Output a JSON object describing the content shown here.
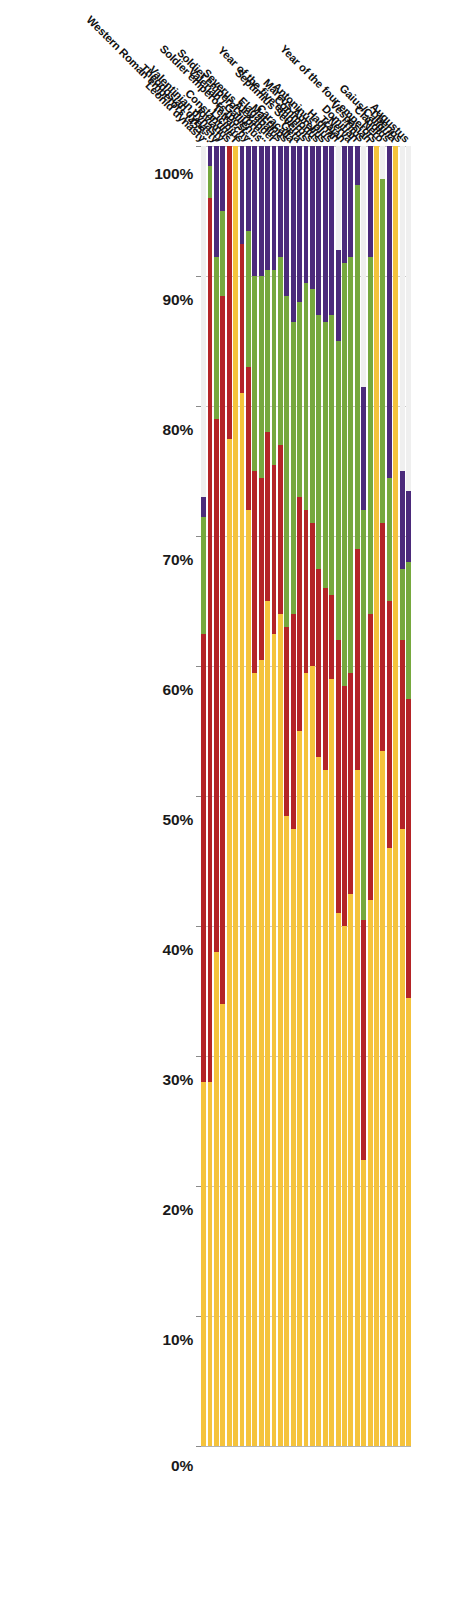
{
  "chart_data": {
    "type": "bar",
    "subtype": "stacked-horizontal-100-percent",
    "title": "",
    "subtitle": "",
    "xlabel": "",
    "ylabel": "",
    "orientation": "rotated-90-degrees",
    "value_axis": {
      "ticks": [
        "100%",
        "90%",
        "80%",
        "70%",
        "60%",
        "50%",
        "40%",
        "30%",
        "20%",
        "10%",
        "0%"
      ],
      "values": [
        100,
        90,
        80,
        70,
        60,
        50,
        40,
        30,
        20,
        10,
        0
      ],
      "range": [
        0,
        100
      ],
      "direction": "100-to-0",
      "grid": true
    },
    "legend": {
      "visible": false,
      "position": "none"
    },
    "series": [
      {
        "name": "series-1",
        "color": "#EFEFEF"
      },
      {
        "name": "series-2",
        "color": "#4B2A7B"
      },
      {
        "name": "series-3",
        "color": "#76A83E"
      },
      {
        "name": "series-4",
        "color": "#B42427"
      },
      {
        "name": "series-5",
        "color": "#F5C33C"
      }
    ],
    "categories": [
      "Augustus",
      "Tiberius",
      "Gaius/Caligula",
      "Claudius",
      "Nero",
      "Year of the four emperors",
      "Vespasian",
      "Titus",
      "Domitian",
      "Nerva",
      "Trajan",
      "Hadrian",
      "Antoninus plus",
      "Marcus Aurelius",
      "Commodus",
      "Year of the five emperors",
      "Septimius Severus",
      "Geta",
      "Caracalla",
      "Macrinus",
      "Elagabalus",
      "Severus Alexander",
      "Soldier emperors (pre-...",
      "Valerian / Gallienus",
      "Soldier emperors (post-...",
      "Tetrarchy",
      "Licinius",
      "Constantine I",
      "Jovianus",
      "Valentinian dynasty",
      "Theodosian dynasty",
      "Western Roman emperors (455-...",
      "Leonid dynasty"
    ],
    "rows": [
      {
        "category": "Augustus",
        "values": [
          26.5,
          5.5,
          10.5,
          23.0,
          34.5
        ]
      },
      {
        "category": "Tiberius",
        "values": [
          25.0,
          7.5,
          5.5,
          14.5,
          47.5
        ]
      },
      {
        "category": "Gaius/Caligula",
        "values": [
          0.0,
          0.0,
          0.0,
          0.0,
          100.0
        ]
      },
      {
        "category": "Claudius",
        "values": [
          0.0,
          25.5,
          9.5,
          19.0,
          46.0
        ]
      },
      {
        "category": "Nero",
        "values": [
          2.5,
          0.0,
          26.5,
          17.5,
          53.5
        ]
      },
      {
        "category": "Year of the four emperors",
        "values": [
          0.0,
          0.0,
          0.0,
          0.0,
          100.0
        ]
      },
      {
        "category": "Vespasian",
        "values": [
          0.0,
          8.5,
          27.5,
          22.0,
          42.0
        ]
      },
      {
        "category": "Titus",
        "values": [
          18.5,
          9.5,
          31.5,
          18.5,
          22.0
        ]
      },
      {
        "category": "Domitian",
        "values": [
          0.0,
          3.0,
          28.0,
          17.0,
          52.0
        ]
      },
      {
        "category": "Nerva",
        "values": [
          0.0,
          8.5,
          32.0,
          17.0,
          42.5
        ]
      },
      {
        "category": "Trajan",
        "values": [
          0.0,
          9.0,
          32.5,
          18.5,
          40.0
        ]
      },
      {
        "category": "Hadrian",
        "values": [
          8.0,
          7.0,
          23.0,
          21.0,
          41.0
        ]
      },
      {
        "category": "Antoninus plus",
        "values": [
          0.0,
          13.0,
          21.5,
          6.5,
          59.0
        ]
      },
      {
        "category": "Marcus Aurelius",
        "values": [
          0.0,
          13.5,
          20.5,
          14.0,
          52.0
        ]
      },
      {
        "category": "Commodus",
        "values": [
          0.0,
          13.0,
          19.5,
          14.5,
          53.0
        ]
      },
      {
        "category": "Year of the five emperors",
        "values": [
          0.0,
          11.0,
          18.0,
          11.0,
          60.0
        ]
      },
      {
        "category": "Septimius Severus",
        "values": [
          0.0,
          10.5,
          17.5,
          12.5,
          59.5
        ]
      },
      {
        "category": "Geta",
        "values": [
          0.0,
          12.0,
          15.0,
          18.0,
          55.0
        ]
      },
      {
        "category": "Caracalla",
        "values": [
          0.0,
          13.5,
          22.5,
          16.5,
          47.5
        ]
      },
      {
        "category": "Macrinus",
        "values": [
          0.0,
          11.5,
          25.5,
          14.5,
          48.5
        ]
      },
      {
        "category": "Elagabalus",
        "values": [
          0.0,
          8.5,
          14.5,
          13.0,
          64.0
        ]
      },
      {
        "category": "Severus Alexander",
        "values": [
          0.0,
          9.5,
          15.0,
          13.0,
          62.5
        ]
      },
      {
        "category": "Soldier emperors (pre-...",
        "values": [
          0.0,
          9.5,
          12.5,
          13.0,
          65.0
        ]
      },
      {
        "category": "Valerian / Gallienus",
        "values": [
          0.0,
          10.0,
          15.5,
          14.0,
          60.5
        ]
      },
      {
        "category": "Soldier emperors (post-...",
        "values": [
          0.0,
          10.0,
          15.0,
          15.5,
          59.5
        ]
      },
      {
        "category": "Tetrarchy",
        "values": [
          0.0,
          6.5,
          10.5,
          11.0,
          72.0
        ]
      },
      {
        "category": "Licinius",
        "values": [
          0.0,
          7.5,
          0.0,
          11.5,
          81.0
        ]
      },
      {
        "category": "Constantine I",
        "values": [
          0.0,
          0.0,
          0.0,
          0.0,
          100.0
        ]
      },
      {
        "category": "Jovianus",
        "values": [
          0.0,
          0.0,
          0.0,
          22.5,
          77.5
        ]
      },
      {
        "category": "Valentinian dynasty",
        "values": [
          0.0,
          5.0,
          6.5,
          54.5,
          34.0
        ]
      },
      {
        "category": "Theodosian dynasty",
        "values": [
          0.0,
          8.5,
          12.5,
          41.0,
          38.0
        ]
      },
      {
        "category": "Western Roman emperors (455-...",
        "values": [
          0.0,
          1.5,
          2.5,
          68.0,
          28.0
        ]
      },
      {
        "category": "Leonid dynasty",
        "values": [
          27.0,
          1.5,
          9.0,
          34.5,
          28.0
        ]
      }
    ]
  }
}
